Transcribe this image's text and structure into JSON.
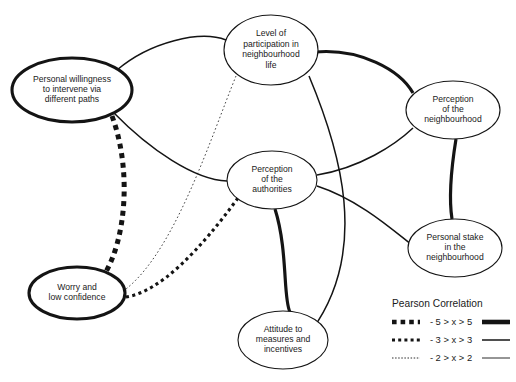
{
  "diagram": {
    "type": "node-link-network",
    "background_color": "#ffffff",
    "stroke_color": "#141414",
    "nodes": [
      {
        "id": "willingness",
        "label_lines": [
          "Personal willingness",
          "to intervene via",
          "different paths"
        ],
        "cx": 72,
        "cy": 90,
        "rx": 60,
        "ry": 32,
        "outline": "bold"
      },
      {
        "id": "participation",
        "label_lines": [
          "Level of",
          "participation in",
          "neighbourhood",
          "life"
        ],
        "cx": 271,
        "cy": 50,
        "rx": 47,
        "ry": 35,
        "outline": "thin"
      },
      {
        "id": "perception_neighbourhood",
        "label_lines": [
          "Perception",
          "of the",
          "neighbourhood"
        ],
        "cx": 453,
        "cy": 110,
        "rx": 47,
        "ry": 29,
        "outline": "thin"
      },
      {
        "id": "perception_authorities",
        "label_lines": [
          "Perception",
          "of the",
          "authorities"
        ],
        "cx": 272,
        "cy": 180,
        "rx": 45,
        "ry": 29,
        "outline": "thin"
      },
      {
        "id": "personal_stake",
        "label_lines": [
          "Personal stake",
          "in the",
          "neighbourhood"
        ],
        "cx": 455,
        "cy": 248,
        "rx": 47,
        "ry": 29,
        "outline": "thin"
      },
      {
        "id": "worry",
        "label_lines": [
          "Worry and",
          "low confidence"
        ],
        "cx": 77,
        "cy": 293,
        "rx": 48,
        "ry": 26,
        "outline": "bold"
      },
      {
        "id": "attitude",
        "label_lines": [
          "Attitude to",
          "measures and",
          "incentives"
        ],
        "cx": 283,
        "cy": 340,
        "rx": 45,
        "ry": 29,
        "outline": "thin"
      }
    ],
    "edges": [
      {
        "id": "willingness-participation",
        "from": "willingness",
        "to": "participation",
        "style": "solid",
        "weight": "medium",
        "path": "M 117 70 C 150 42, 200 30, 226 40"
      },
      {
        "id": "participation-perception_neighbourhood",
        "from": "participation",
        "to": "perception_neighbourhood",
        "style": "solid",
        "weight": "thick",
        "path": "M 315 52 C 360 48, 400 70, 413 93"
      },
      {
        "id": "willingness-perception_authorities",
        "from": "willingness",
        "to": "perception_authorities",
        "style": "solid",
        "weight": "medium",
        "path": "M 113 112 C 150 150, 195 180, 227 181"
      },
      {
        "id": "participation-worry",
        "from": "participation",
        "to": "worry",
        "style": "fine-dot",
        "weight": "thin",
        "path": "M 236 76 C 210 140, 175 250, 126 289"
      },
      {
        "id": "participation-attitude",
        "from": "participation",
        "to": "attitude",
        "style": "solid",
        "weight": "medium",
        "path": "M 309 76 C 340 150, 370 250, 312 330"
      },
      {
        "id": "perception_authorities-perception_neighbourhood",
        "from": "perception_authorities",
        "to": "perception_neighbourhood",
        "style": "solid",
        "weight": "medium",
        "path": "M 317 175 C 360 168, 395 145, 413 128"
      },
      {
        "id": "perception_neighbourhood-personal_stake",
        "from": "perception_neighbourhood",
        "to": "personal_stake",
        "style": "solid",
        "weight": "thick",
        "path": "M 456 139 C 451 170, 449 200, 452 219"
      },
      {
        "id": "perception_authorities-personal_stake",
        "from": "perception_authorities",
        "to": "personal_stake",
        "style": "solid",
        "weight": "medium",
        "path": "M 317 186 C 360 200, 395 232, 412 245"
      },
      {
        "id": "perception_authorities-attitude",
        "from": "perception_authorities",
        "to": "attitude",
        "style": "solid",
        "weight": "thick",
        "path": "M 275 209 C 288 250, 283 300, 290 312"
      },
      {
        "id": "willingness-worry",
        "from": "willingness",
        "to": "worry",
        "style": "dash",
        "weight": "thick",
        "path": "M 112 116 C 132 170, 126 240, 104 275"
      },
      {
        "id": "perception_authorities-worry",
        "from": "perception_authorities",
        "to": "worry",
        "style": "dot",
        "weight": "thick",
        "path": "M 238 198 C 200 250, 160 292, 126 297"
      }
    ]
  },
  "legend": {
    "title": "Pearson Correlation",
    "x": 392,
    "y": 300,
    "rows": [
      {
        "id": "row-strong",
        "range": "- 5 > x > 5",
        "negative_style": "dash",
        "positive_style": "thick"
      },
      {
        "id": "row-moderate",
        "range": "- 3 > x > 3",
        "negative_style": "dot",
        "positive_style": "medium"
      },
      {
        "id": "row-weak",
        "range": "- 2 > x > 2",
        "negative_style": "fine-dot",
        "positive_style": "thin"
      }
    ]
  }
}
